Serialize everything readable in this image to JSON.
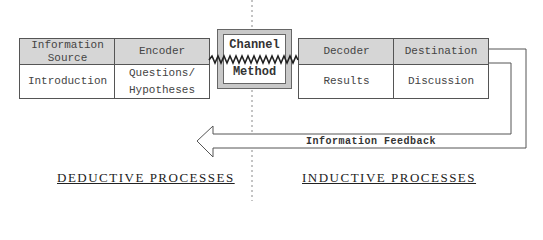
{
  "diagram": {
    "left_table": {
      "headers": [
        "Information\nSource",
        "Encoder"
      ],
      "header_lines": [
        [
          "Information",
          "Source"
        ],
        [
          "Encoder"
        ]
      ],
      "cells": [
        [
          "Introduction"
        ],
        [
          "Questions/",
          "Hypotheses"
        ]
      ]
    },
    "channel": {
      "line1": "Channel",
      "line2": "Method"
    },
    "right_table": {
      "headers": [
        "Decoder",
        "Destination"
      ],
      "cells": [
        "Results",
        "Discussion"
      ]
    },
    "feedback_label": "Information Feedback",
    "bottom_labels": {
      "left": "DEDUCTIVE PROCESSES",
      "right": "INDUCTIVE PROCESSES"
    },
    "colors": {
      "header_fill": "#d6d6d6",
      "channel_frame": "#c8c8c8",
      "line": "#555555"
    }
  }
}
